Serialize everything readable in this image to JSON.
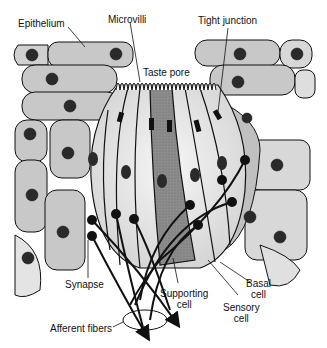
{
  "labels": {
    "epithelium": "Epithelium",
    "microvilli": "Microvilli",
    "tight_junction": "Tight junction",
    "taste_pore": "Taste pore",
    "synapse": "Synapse",
    "supporting_cell_1": "Supporting",
    "supporting_cell_2": "cell",
    "basal_cell_1": "Basal",
    "basal_cell_2": "cell",
    "sensory_cell_1": "Sensory",
    "sensory_cell_2": "cell",
    "afferent_fibers": "Afferent fibers"
  },
  "colors": {
    "epithelial_cell_fill": "#c8c8c8",
    "taste_cell_fill": "#eeeeee",
    "supporting_cell_fill": "#8a8a8a",
    "nucleus_fill": "#2a2a2a",
    "outline": "#111111"
  }
}
